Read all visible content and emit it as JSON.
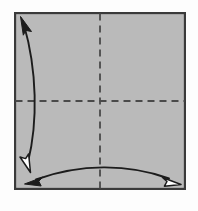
{
  "diagram": {
    "type": "origami-fold-step",
    "title": "Origami square with horizontal and vertical crease lines and two fold arrows",
    "canvas": {
      "width": 198,
      "height": 211,
      "background": "#fdfdfd"
    },
    "paper": {
      "shape": "square",
      "x": 14,
      "y": 12,
      "width": 172,
      "height": 178,
      "fill": "#b9b9b9",
      "stroke": "#3a3a3a",
      "stroke_width": 2.2,
      "label": "paper-square"
    },
    "creases": [
      {
        "name": "vertical-crease-line",
        "orientation": "vertical",
        "x1": 100,
        "y1": 12,
        "x2": 100,
        "y2": 190,
        "style": "dashed",
        "dash_pattern": "7,5",
        "stroke": "#4a4a4a",
        "stroke_width": 1.8
      },
      {
        "name": "horizontal-crease-line",
        "orientation": "horizontal",
        "x1": 14,
        "y1": 101,
        "x2": 186,
        "y2": 101,
        "style": "dashed",
        "dash_pattern": "7,5",
        "stroke": "#4a4a4a",
        "stroke_width": 1.8
      }
    ],
    "arrows": [
      {
        "name": "vertical-fold-arrow",
        "description": "Curved double-headed arrow along the left side indicating bottom edge folds up to top edge",
        "path": "M 23 22 C 38 70, 38 120, 27 165",
        "stroke": "#1c1c1c",
        "stroke_width": 1.9,
        "start_head": {
          "type": "solid",
          "name": "arrowhead-solid-top-left",
          "fill": "#1c1c1c"
        },
        "end_head": {
          "type": "hollow",
          "name": "arrowhead-hollow-bottom-left",
          "fill": "#ffffff"
        }
      },
      {
        "name": "horizontal-fold-arrow",
        "description": "Curved double-headed arrow along the bottom edge indicating right edge folds over to left edge",
        "path": "M 33 180 C 80 163, 130 163, 172 179",
        "stroke": "#1c1c1c",
        "stroke_width": 1.9,
        "start_head": {
          "type": "solid",
          "name": "arrowhead-solid-bottom-left",
          "fill": "#1c1c1c"
        },
        "end_head": {
          "type": "hollow",
          "name": "arrowhead-hollow-bottom-right",
          "fill": "#ffffff"
        }
      }
    ],
    "center_point": {
      "x": 100,
      "y": 101,
      "name": "crease-intersection"
    }
  }
}
